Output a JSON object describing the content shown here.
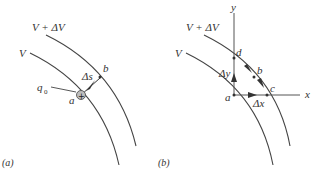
{
  "figure": {
    "panels": [
      {
        "id": "a",
        "panel_label": "(a)",
        "equipotentials": [
          {
            "label": "V + ΔV",
            "role": "outer"
          },
          {
            "label": "V",
            "role": "inner"
          }
        ],
        "points": [
          {
            "label": "a",
            "description": "position of test charge on V"
          },
          {
            "label": "b",
            "description": "point on V + ΔV"
          }
        ],
        "charge": {
          "label": "q",
          "subscript": "0",
          "symbol": "+"
        },
        "displacement": {
          "label": "Δs",
          "from": "a",
          "to": "b"
        }
      },
      {
        "id": "b",
        "panel_label": "(b)",
        "equipotentials": [
          {
            "label": "V + ΔV",
            "role": "outer"
          },
          {
            "label": "V",
            "role": "inner"
          }
        ],
        "axes": {
          "x": "x",
          "y": "y"
        },
        "points": [
          {
            "label": "a"
          },
          {
            "label": "b"
          },
          {
            "label": "c"
          },
          {
            "label": "d"
          }
        ],
        "displacements": [
          {
            "label": "Δx",
            "from": "a",
            "to": "c"
          },
          {
            "label": "Δy",
            "from": "a",
            "to": "d"
          }
        ]
      }
    ],
    "colors": {
      "line": "#444444",
      "charge_fill": "#bdbdbd"
    }
  }
}
